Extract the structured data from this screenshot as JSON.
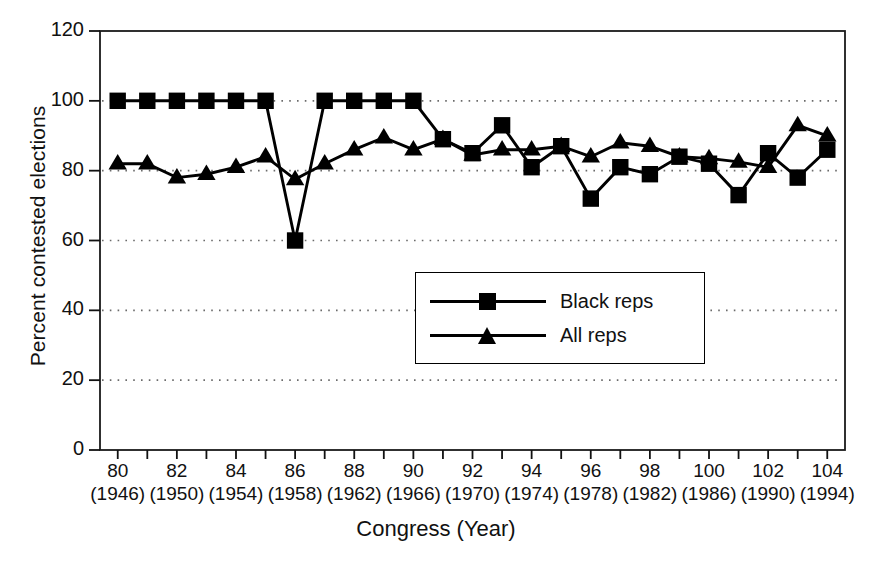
{
  "chart_data": {
    "type": "line",
    "title": "",
    "xlabel": "Congress (Year)",
    "ylabel": "Percent contested elections",
    "ylim": [
      0,
      120
    ],
    "ytick_values": [
      0,
      20,
      40,
      60,
      80,
      100,
      120
    ],
    "ytick_labels": [
      "0",
      "20",
      "40",
      "60",
      "80",
      "100",
      "120"
    ],
    "xlim": [
      79.4,
      104.6
    ],
    "x": [
      80,
      81,
      82,
      83,
      84,
      85,
      86,
      87,
      88,
      89,
      90,
      91,
      92,
      93,
      94,
      95,
      96,
      97,
      98,
      99,
      100,
      101,
      102,
      103,
      104
    ],
    "xtick_values": [
      80,
      82,
      84,
      86,
      88,
      90,
      92,
      94,
      96,
      98,
      100,
      102,
      104
    ],
    "xtick_labels": [
      {
        "congress": "80",
        "year": "(1946)"
      },
      {
        "congress": "82",
        "year": "(1950)"
      },
      {
        "congress": "84",
        "year": "(1954)"
      },
      {
        "congress": "86",
        "year": "(1958)"
      },
      {
        "congress": "88",
        "year": "(1962)"
      },
      {
        "congress": "90",
        "year": "(1966)"
      },
      {
        "congress": "92",
        "year": "(1970)"
      },
      {
        "congress": "94",
        "year": "(1974)"
      },
      {
        "congress": "96",
        "year": "(1978)"
      },
      {
        "congress": "98",
        "year": "(1982)"
      },
      {
        "congress": "100",
        "year": "(1986)"
      },
      {
        "congress": "102",
        "year": "(1990)"
      },
      {
        "congress": "104",
        "year": "(1994)"
      }
    ],
    "grid": "horizontal-dotted",
    "legend_position": "center",
    "series": [
      {
        "name": "Black reps",
        "marker": "square",
        "color": "#000000",
        "values": [
          100,
          100,
          100,
          100,
          100,
          100,
          60,
          100,
          100,
          100,
          100,
          89,
          85,
          93,
          81,
          87,
          72,
          81,
          79,
          84,
          82,
          73,
          85,
          78,
          86
        ]
      },
      {
        "name": "All reps",
        "marker": "triangle",
        "color": "#000000",
        "values": [
          82,
          82,
          78,
          79,
          81,
          84,
          77.5,
          82,
          86,
          89.5,
          86,
          89,
          84.5,
          86,
          86,
          87,
          84,
          88,
          87,
          84,
          83.5,
          82.5,
          81,
          93,
          90
        ]
      }
    ]
  },
  "legend": {
    "entries": [
      {
        "label": "Black reps",
        "marker": "square"
      },
      {
        "label": "All reps",
        "marker": "triangle"
      }
    ]
  },
  "axes": {
    "x_title": "Congress (Year)",
    "y_title": "Percent contested elections"
  },
  "colors": {
    "ink": "#000000",
    "background": "#ffffff",
    "grid": "#6b6b6b"
  }
}
